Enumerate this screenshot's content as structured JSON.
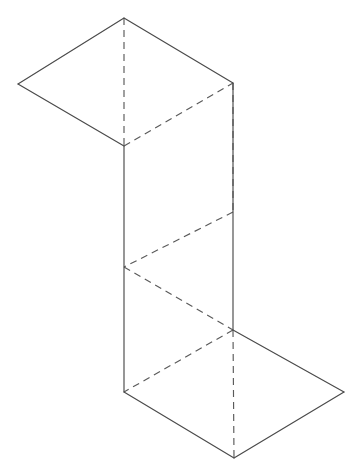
{
  "figure": {
    "canvas": {
      "width": 364,
      "height": 474,
      "background": "#ffffff"
    },
    "styles": {
      "solid_stroke_color": "#4a4a4a",
      "dashed_stroke_color": "#5a5a5a",
      "stroke_width": 1.15,
      "dash_pattern": "7 5",
      "face_fill": "#ffffff"
    },
    "vertices": {
      "top_apex": [
        124,
        18
      ],
      "top_left": [
        18,
        84
      ],
      "top_right": [
        233,
        83
      ],
      "mid_upper_left": [
        124,
        146
      ],
      "mid_right_upper": [
        233,
        212
      ],
      "mid_left_lower": [
        124,
        267
      ],
      "mid_right_lower": [
        233,
        330
      ],
      "bottom_left": [
        124,
        392
      ],
      "bottom_apex": [
        234,
        458
      ],
      "bottom_right": [
        344,
        392
      ]
    },
    "faces": [
      {
        "name": "top-face",
        "kind": "parallelogram",
        "points": "124,18 18,84 124,146 233,83"
      },
      {
        "name": "body-face",
        "kind": "rectangle",
        "points": "124,146 233,83 233,330 124,392"
      },
      {
        "name": "bottom-face",
        "kind": "parallelogram",
        "points": "124,392 234,458 344,392 233,330"
      }
    ],
    "solid_edges": [
      {
        "name": "top-face-upper-left-edge",
        "points": "124,18 18,84"
      },
      {
        "name": "top-face-lower-left-edge",
        "points": "18,84 124,146"
      },
      {
        "name": "top-face-upper-right-edge",
        "points": "124,18 233,83"
      },
      {
        "name": "body-left-vertical-edge",
        "points": "124,146 124,392"
      },
      {
        "name": "body-right-vertical-edge",
        "points": "233,83 233,330"
      },
      {
        "name": "bottom-face-lower-left-edge",
        "points": "124,392 234,458"
      },
      {
        "name": "bottom-face-lower-right-edge",
        "points": "234,458 344,392"
      },
      {
        "name": "bottom-face-upper-right-edge",
        "points": "344,392 233,330"
      }
    ],
    "dashed_edges": [
      {
        "name": "top-center-vertical-hidden-edge",
        "points": "124,18 124,146"
      },
      {
        "name": "zigzag-hidden-edge-1",
        "points": "124,146 233,83"
      },
      {
        "name": "zigzag-hidden-edge-2",
        "points": "233,83 233,212"
      },
      {
        "name": "zigzag-hidden-edge-3",
        "points": "233,212 124,267"
      },
      {
        "name": "zigzag-hidden-edge-4",
        "points": "124,267 233,330"
      },
      {
        "name": "zigzag-hidden-edge-5",
        "points": "233,330 124,392"
      },
      {
        "name": "bottom-center-vertical-hidden-edge",
        "points": "233,330 234,458"
      }
    ]
  }
}
